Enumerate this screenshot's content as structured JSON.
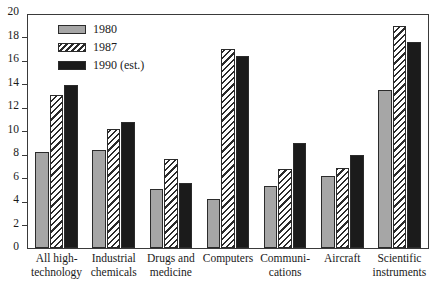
{
  "chart_data": {
    "type": "bar",
    "title": "",
    "subtitle": "",
    "xlabel": "",
    "ylabel": "",
    "ylim": [
      0,
      20
    ],
    "ytick_step": 2,
    "yticks": [
      0,
      2,
      4,
      6,
      8,
      10,
      12,
      14,
      16,
      18,
      20
    ],
    "ytick_labels": [
      "0",
      "2",
      "4",
      "6",
      "8",
      "10",
      "12",
      "14",
      "16",
      "18",
      "20"
    ],
    "grid": false,
    "legend_position": "top-left",
    "orientation": "vertical",
    "grouping": "grouped",
    "categories": [
      "All high-technology",
      "Industrial chemicals",
      "Drugs and medicine",
      "Computers",
      "Communications",
      "Aircraft",
      "Scientific instruments"
    ],
    "category_lines": [
      [
        "All high-",
        "technology"
      ],
      [
        "Industrial",
        "chemicals"
      ],
      [
        "Drugs and",
        "medicine"
      ],
      [
        "Computers",
        ""
      ],
      [
        "Communi-",
        "cations"
      ],
      [
        "Aircraft",
        ""
      ],
      [
        "Scientific",
        "instruments"
      ]
    ],
    "series": [
      {
        "name": "1980",
        "color": "#a6a6a6",
        "pattern": "solid",
        "values": [
          8.2,
          8.4,
          5.1,
          4.2,
          5.3,
          6.2,
          13.6
        ]
      },
      {
        "name": "1987",
        "color": "#ffffff",
        "pattern": "diagonal-hatch",
        "values": [
          13.1,
          10.2,
          7.6,
          17.1,
          6.8,
          6.9,
          19.1
        ]
      },
      {
        "name": "1990 (est.)",
        "color": "#1b1b1b",
        "pattern": "solid",
        "values": [
          14.0,
          10.8,
          5.6,
          16.5,
          9.0,
          8.0,
          17.7
        ]
      }
    ],
    "annotations": []
  },
  "legend": {
    "entries": [
      {
        "label": "1980"
      },
      {
        "label": "1987"
      },
      {
        "label": "1990 (est.)"
      }
    ]
  },
  "colors": {
    "series_1980": "#a6a6a6",
    "series_1987": "#ffffff",
    "series_1990": "#1b1b1b",
    "axis": "#3a3a3a",
    "text": "#1a1a1a",
    "background": "#ffffff"
  }
}
